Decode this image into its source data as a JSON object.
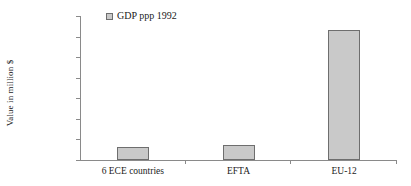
{
  "chart_data": {
    "type": "bar",
    "title": "",
    "subtitle": "",
    "xlabel": "",
    "ylabel": "Value in million $",
    "categories": [
      "6 ECE countries",
      "EFTA",
      "EU-12"
    ],
    "series": [
      {
        "name": "GDP ppp 1992",
        "values": [
          650000,
          720000,
          6300000
        ],
        "color": "#c9c9c9"
      }
    ],
    "ylim": [
      0,
      7000000
    ],
    "ytick_values": [
      0,
      1000000,
      2000000,
      3000000,
      4000000,
      5000000,
      6000000,
      7000000
    ],
    "ytick_labels": [
      "0",
      "1,000,000",
      "2,000,000",
      "3,000,000",
      "4,000,000",
      "5,000,000",
      "6,000,000",
      "7,000,000"
    ],
    "grid": false,
    "legend": {
      "position": "top-left-inside",
      "entries": [
        {
          "label": "GDP ppp 1992",
          "swatch_color": "#c9c9c9",
          "swatch_border": "#6e6e6e"
        }
      ]
    },
    "axis_color": "#8a8a8a",
    "bar_border_color": "#6e6e6e",
    "background": "#ffffff"
  }
}
